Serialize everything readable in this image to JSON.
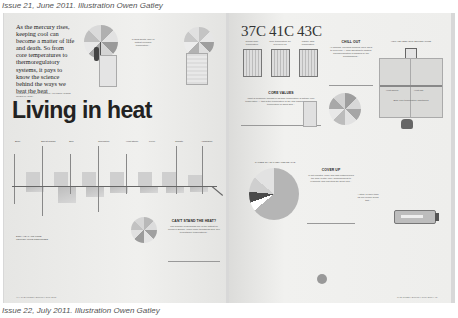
{
  "caption_top": "Issue 21, June 2011. Illustration Owen Gatley",
  "caption_bottom": "Issue 22, July 2011. Illustration Owen Gatley",
  "left_page": {
    "intro_text": "As the mercury rises, keeping cool can become a matter of life and death. So from core temperatures to thermoregulatory systems, it pays to know the science behind the ways we beat the heat",
    "byline": "WORDS FRANCES JAMIESON / ILLUSTRATIONS OWEN GATLEY",
    "headline": "Living in heat",
    "sidenote": "In 2003 Death Valley's hottest recorded temperature...",
    "timeline_labels": [
      "Body",
      "Sweat glands",
      "Skin",
      "Circulation",
      "Heat stroke",
      "Fever",
      "Climate",
      "Adaptation"
    ],
    "footnote": "BODY HEAT AND CORE TEMPERATURE RESPONSES",
    "box_title": "CAN'T STAND THE HEAT?",
    "box_text": "The summer of 2003 saw one of the hottest on record in Europe. When many thousands died, due to heatwave temperatures...",
    "folio": "44 • THE TIMES • Eureka • June 2011"
  },
  "right_page": {
    "temperatures": [
      "37C",
      "41C",
      "43C"
    ],
    "temp_captions": [
      "Normal body temperature",
      "Core temperature for hyperpyrexia",
      "Usually fatal temperature"
    ],
    "core_values_title": "CORE VALUES",
    "core_values_text": "What is commonly thought of as body temperature is actually core temperature — that is the temperature of the vital organs. Normal core temperature is about 37C...",
    "chill_out_title": "CHILL OUT",
    "chill_out_text": "All animals, including humans, have ways to keep cool — from sweating to panting. Thermoregulation is handled by the hypothalamus...",
    "diagram_title": "HOW WE KEEP OUR TEMPERATURE",
    "diagram_labels": [
      "Heat gained",
      "Heat lost",
      "Body core temperature maintained"
    ],
    "pie_title": "CAUSES OF HEAT-RELATED DEATHS",
    "cover_up_title": "COVER UP",
    "cover_up_text": "In hot climates, loose and light clothing helps the body to stay cool, allowing sweat to evaporate and reflecting the sun's rays...",
    "side_text": "A study of more than 12,000 people found that...",
    "folio": "THE TIMES • Eureka • June 2011 • 45"
  },
  "colors": {
    "paper": "#eeeeec",
    "ink": "#222222",
    "shadow": "#bdbdbd"
  }
}
